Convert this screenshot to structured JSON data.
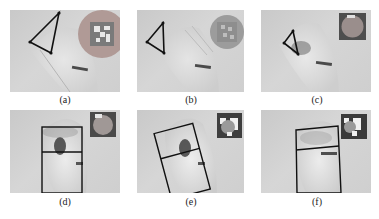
{
  "figure": {
    "panels": [
      {
        "id": "a",
        "caption": "(a)",
        "overlay": "triangle",
        "marker": "aruco-circle-large"
      },
      {
        "id": "b",
        "caption": "(b)",
        "overlay": "triangle",
        "marker": "aruco-circle-blurred"
      },
      {
        "id": "c",
        "caption": "(c)",
        "overlay": "triangle",
        "marker": "circle-in-square"
      },
      {
        "id": "d",
        "caption": "(d)",
        "overlay": "split-rectangle",
        "marker": "circle-in-square"
      },
      {
        "id": "e",
        "caption": "(e)",
        "overlay": "split-rectangle-rotated",
        "marker": "aruco-partial"
      },
      {
        "id": "f",
        "caption": "(f)",
        "overlay": "split-rectangle",
        "marker": "aruco-partial"
      }
    ]
  }
}
